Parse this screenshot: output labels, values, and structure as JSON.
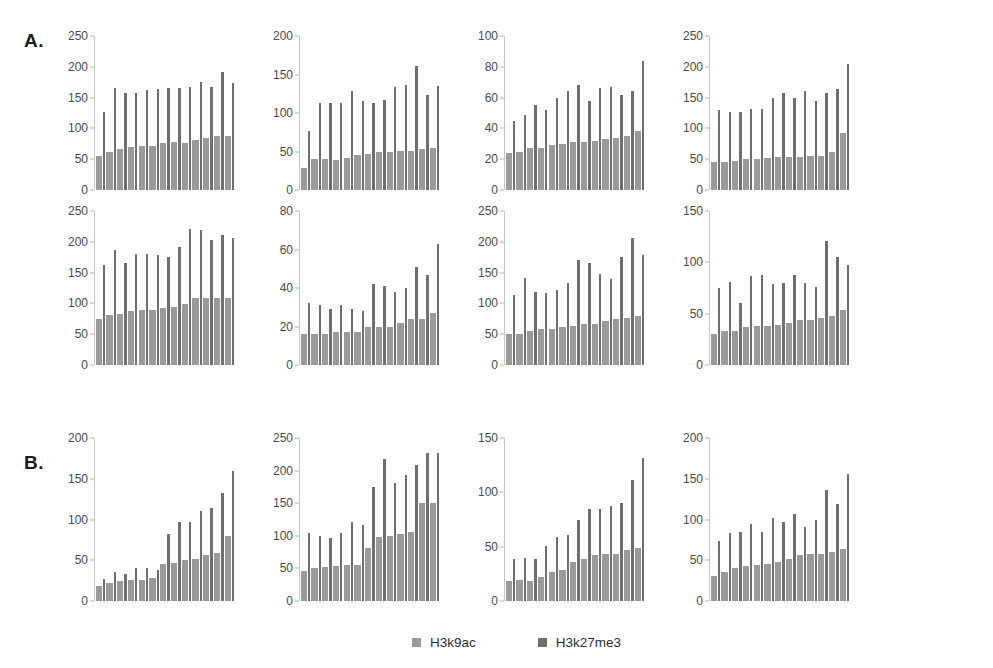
{
  "panels": [
    {
      "label": "A."
    },
    {
      "label": "B."
    }
  ],
  "legend": {
    "items": [
      {
        "name": "H3k9ac",
        "color": "#9a9a9a"
      },
      {
        "name": "H3k27me3",
        "color": "#6f6f6f"
      }
    ]
  },
  "chart_data": [
    {
      "id": "A-r1-c1",
      "type": "bar",
      "title": "",
      "xlabel": "",
      "ylabel": "",
      "ylim": [
        0,
        250
      ],
      "yticks": [
        0,
        50,
        100,
        150,
        200,
        250
      ],
      "grid": false,
      "legend_position": "figure-bottom-center",
      "categories": [
        "1",
        "2",
        "3",
        "4",
        "5",
        "6",
        "7",
        "8",
        "9",
        "10",
        "11",
        "12",
        "13"
      ],
      "series": [
        {
          "name": "H3k9ac",
          "values": [
            56,
            62,
            66,
            70,
            72,
            71,
            77,
            78,
            77,
            81,
            85,
            87,
            88
          ]
        },
        {
          "name": "H3k27me3",
          "values": [
            127,
            166,
            158,
            158,
            163,
            164,
            165,
            165,
            168,
            176,
            167,
            191,
            173
          ]
        }
      ]
    },
    {
      "id": "A-r1-c2",
      "type": "bar",
      "title": "",
      "xlabel": "",
      "ylabel": "",
      "ylim": [
        0,
        200
      ],
      "yticks": [
        0,
        50,
        100,
        150,
        200
      ],
      "grid": false,
      "legend_position": "figure-bottom-center",
      "categories": [
        "1",
        "2",
        "3",
        "4",
        "5",
        "6",
        "7",
        "8",
        "9",
        "10",
        "11",
        "12",
        "13"
      ],
      "series": [
        {
          "name": "H3k9ac",
          "values": [
            29,
            40,
            40,
            39,
            42,
            46,
            47,
            50,
            50,
            51,
            51,
            53,
            55
          ]
        },
        {
          "name": "H3k27me3",
          "values": [
            76,
            113,
            113,
            113,
            128,
            115,
            113,
            117,
            134,
            136,
            161,
            124,
            135
          ]
        }
      ]
    },
    {
      "id": "A-r1-c3",
      "type": "bar",
      "title": "",
      "xlabel": "",
      "ylabel": "",
      "ylim": [
        0,
        100
      ],
      "yticks": [
        0,
        20,
        40,
        60,
        80,
        100
      ],
      "grid": false,
      "legend_position": "figure-bottom-center",
      "categories": [
        "1",
        "2",
        "3",
        "4",
        "5",
        "6",
        "7",
        "8",
        "9",
        "10",
        "11",
        "12",
        "13"
      ],
      "series": [
        {
          "name": "H3k9ac",
          "values": [
            24,
            25,
            27,
            27,
            29,
            30,
            31,
            31,
            32,
            33,
            34,
            35,
            38
          ]
        },
        {
          "name": "H3k27me3",
          "values": [
            45,
            49,
            55,
            52,
            60,
            64,
            68,
            58,
            66,
            67,
            62,
            64,
            84
          ]
        }
      ]
    },
    {
      "id": "A-r1-c4",
      "type": "bar",
      "title": "",
      "xlabel": "",
      "ylabel": "",
      "ylim": [
        0,
        250
      ],
      "yticks": [
        0,
        50,
        100,
        150,
        200,
        250
      ],
      "grid": false,
      "legend_position": "figure-bottom-center",
      "categories": [
        "1",
        "2",
        "3",
        "4",
        "5",
        "6",
        "7",
        "8",
        "9",
        "10",
        "11",
        "12",
        "13"
      ],
      "series": [
        {
          "name": "H3k9ac",
          "values": [
            45,
            45,
            47,
            50,
            51,
            52,
            54,
            54,
            54,
            55,
            56,
            61,
            93
          ]
        },
        {
          "name": "H3k27me3",
          "values": [
            130,
            126,
            126,
            131,
            131,
            150,
            158,
            149,
            161,
            145,
            157,
            164,
            205
          ]
        }
      ]
    },
    {
      "id": "A-r2-c1",
      "type": "bar",
      "title": "",
      "xlabel": "",
      "ylabel": "",
      "ylim": [
        0,
        250
      ],
      "yticks": [
        0,
        50,
        100,
        150,
        200,
        250
      ],
      "grid": false,
      "legend_position": "figure-bottom-center",
      "categories": [
        "1",
        "2",
        "3",
        "4",
        "5",
        "6",
        "7",
        "8",
        "9",
        "10",
        "11",
        "12",
        "13"
      ],
      "series": [
        {
          "name": "H3k9ac",
          "values": [
            74,
            82,
            83,
            88,
            89,
            90,
            92,
            94,
            99,
            109,
            109,
            108,
            109
          ]
        },
        {
          "name": "H3k27me3",
          "values": [
            162,
            186,
            166,
            180,
            181,
            179,
            176,
            191,
            221,
            219,
            203,
            211,
            207
          ]
        }
      ]
    },
    {
      "id": "A-r2-c2",
      "type": "bar",
      "title": "",
      "xlabel": "",
      "ylabel": "",
      "ylim": [
        0,
        80
      ],
      "yticks": [
        0,
        20,
        40,
        60,
        80
      ],
      "grid": false,
      "legend_position": "figure-bottom-center",
      "categories": [
        "1",
        "2",
        "3",
        "4",
        "5",
        "6",
        "7",
        "8",
        "9",
        "10",
        "11",
        "12",
        "13"
      ],
      "series": [
        {
          "name": "H3k9ac",
          "values": [
            16,
            16,
            16,
            17,
            17,
            17,
            20,
            20,
            20,
            22,
            24,
            24,
            27
          ]
        },
        {
          "name": "H3k27me3",
          "values": [
            32,
            31,
            29,
            31,
            29,
            28,
            42,
            41,
            38,
            40,
            51,
            47,
            63
          ]
        }
      ]
    },
    {
      "id": "A-r2-c3",
      "type": "bar",
      "title": "",
      "xlabel": "",
      "ylabel": "",
      "ylim": [
        0,
        250
      ],
      "yticks": [
        0,
        50,
        100,
        150,
        200,
        250
      ],
      "grid": false,
      "legend_position": "figure-bottom-center",
      "categories": [
        "1",
        "2",
        "3",
        "4",
        "5",
        "6",
        "7",
        "8",
        "9",
        "10",
        "11",
        "12",
        "13"
      ],
      "series": [
        {
          "name": "H3k9ac",
          "values": [
            51,
            51,
            55,
            59,
            59,
            62,
            64,
            67,
            67,
            71,
            75,
            76,
            79
          ]
        },
        {
          "name": "H3k27me3",
          "values": [
            114,
            141,
            119,
            117,
            122,
            133,
            170,
            166,
            148,
            140,
            175,
            206,
            178
          ]
        }
      ]
    },
    {
      "id": "A-r2-c4",
      "type": "bar",
      "title": "",
      "xlabel": "",
      "ylabel": "",
      "ylim": [
        0,
        150
      ],
      "yticks": [
        0,
        50,
        100,
        150
      ],
      "grid": false,
      "legend_position": "figure-bottom-center",
      "categories": [
        "1",
        "2",
        "3",
        "4",
        "5",
        "6",
        "7",
        "8",
        "9",
        "10",
        "11",
        "12",
        "13"
      ],
      "series": [
        {
          "name": "H3k9ac",
          "values": [
            30,
            33,
            33,
            37,
            38,
            38,
            39,
            41,
            44,
            44,
            46,
            48,
            54
          ]
        },
        {
          "name": "H3k27me3",
          "values": [
            75,
            81,
            60,
            87,
            88,
            79,
            80,
            88,
            80,
            76,
            121,
            105,
            97
          ]
        }
      ]
    },
    {
      "id": "B-c1",
      "type": "bar",
      "title": "",
      "xlabel": "",
      "ylabel": "",
      "ylim": [
        0,
        200
      ],
      "yticks": [
        0,
        50,
        100,
        150,
        200
      ],
      "grid": false,
      "legend_position": "figure-bottom-center",
      "categories": [
        "1",
        "2",
        "3",
        "4",
        "5",
        "6",
        "7",
        "8",
        "9",
        "10",
        "11",
        "12",
        "13"
      ],
      "series": [
        {
          "name": "H3k9ac",
          "values": [
            18,
            22,
            24,
            26,
            26,
            28,
            46,
            47,
            50,
            52,
            57,
            59,
            80
          ]
        },
        {
          "name": "H3k27me3",
          "values": [
            27,
            35,
            33,
            41,
            40,
            38,
            82,
            97,
            97,
            110,
            114,
            133,
            159
          ]
        }
      ]
    },
    {
      "id": "B-c2",
      "type": "bar",
      "title": "",
      "xlabel": "",
      "ylabel": "",
      "ylim": [
        0,
        250
      ],
      "yticks": [
        0,
        50,
        100,
        150,
        200,
        250
      ],
      "grid": false,
      "legend_position": "figure-bottom-center",
      "categories": [
        "1",
        "2",
        "3",
        "4",
        "5",
        "6",
        "7",
        "8",
        "9",
        "10",
        "11",
        "12",
        "13"
      ],
      "series": [
        {
          "name": "H3k9ac",
          "values": [
            46,
            50,
            52,
            53,
            55,
            56,
            81,
            98,
            100,
            103,
            106,
            150,
            151
          ]
        },
        {
          "name": "H3k27me3",
          "values": [
            104,
            100,
            96,
            104,
            121,
            116,
            175,
            218,
            181,
            194,
            209,
            227,
            227
          ]
        }
      ]
    },
    {
      "id": "B-c3",
      "type": "bar",
      "title": "",
      "xlabel": "",
      "ylabel": "",
      "ylim": [
        0,
        150
      ],
      "yticks": [
        0,
        50,
        100,
        150
      ],
      "grid": false,
      "legend_position": "figure-bottom-center",
      "categories": [
        "1",
        "2",
        "3",
        "4",
        "5",
        "6",
        "7",
        "8",
        "9",
        "10",
        "11",
        "12",
        "13"
      ],
      "series": [
        {
          "name": "H3k9ac",
          "values": [
            18,
            19,
            18,
            22,
            27,
            29,
            36,
            39,
            42,
            43,
            43,
            47,
            49
          ]
        },
        {
          "name": "H3k27me3",
          "values": [
            39,
            40,
            39,
            51,
            59,
            61,
            75,
            85,
            85,
            87,
            90,
            111,
            132
          ]
        }
      ]
    },
    {
      "id": "B-c4",
      "type": "bar",
      "title": "",
      "xlabel": "",
      "ylabel": "",
      "ylim": [
        0,
        200
      ],
      "yticks": [
        0,
        50,
        100,
        150,
        200
      ],
      "grid": false,
      "legend_position": "figure-bottom-center",
      "categories": [
        "1",
        "2",
        "3",
        "4",
        "5",
        "6",
        "7",
        "8",
        "9",
        "10",
        "11",
        "12",
        "13"
      ],
      "series": [
        {
          "name": "H3k9ac",
          "values": [
            31,
            36,
            40,
            43,
            44,
            45,
            48,
            51,
            57,
            58,
            58,
            60,
            64
          ]
        },
        {
          "name": "H3k27me3",
          "values": [
            74,
            84,
            85,
            94,
            85,
            102,
            97,
            107,
            91,
            100,
            136,
            119,
            156
          ]
        }
      ]
    }
  ]
}
